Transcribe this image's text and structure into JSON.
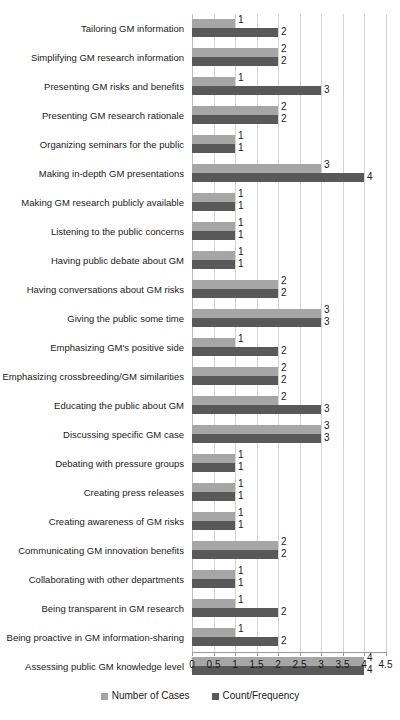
{
  "chart_data": {
    "type": "bar",
    "orientation": "horizontal",
    "title": "",
    "subtitle": "",
    "xlabel": "",
    "ylabel": "",
    "xlim": [
      0,
      4.5
    ],
    "xticks": [
      "0",
      "0.5",
      "1",
      "1.5",
      "2",
      "2.5",
      "3",
      "3.5",
      "4",
      "4.5"
    ],
    "xtick_values": [
      0,
      0.5,
      1,
      1.5,
      2,
      2.5,
      3,
      3.5,
      4,
      4.5
    ],
    "grid": true,
    "grid_axis": "x",
    "legend_position": "bottom",
    "categories": [
      "Tailoring GM information",
      "Simplifying GM research information",
      "Presenting GM risks and benefits",
      "Presenting GM research rationale",
      "Organizing seminars for the public",
      "Making in-depth GM presentations",
      "Making GM research publicly available",
      "Listening to the public concerns",
      "Having public debate about GM",
      "Having conversations about GM risks",
      "Giving the public some time",
      "Emphasizing GM's positive side",
      "Emphasizing crossbreeding/GM similarities",
      "Educating the public about GM",
      "Discussing specific GM case",
      "Debating with pressure groups",
      "Creating press releases",
      "Creating awareness of GM risks",
      "Communicating GM innovation benefits",
      "Collaborating with other departments",
      "Being transparent in GM research",
      "Being proactive in GM information-sharing",
      "Assessing public GM knowledge level"
    ],
    "series": [
      {
        "name": "Number of Cases",
        "color": "#a6a6a6",
        "values": [
          1,
          2,
          1,
          2,
          1,
          3,
          1,
          1,
          1,
          2,
          3,
          1,
          2,
          2,
          3,
          1,
          1,
          1,
          2,
          1,
          1,
          1,
          4
        ],
        "labels": [
          "1",
          "2",
          "1",
          "2",
          "1",
          "3",
          "1",
          "1",
          "1",
          "2",
          "3",
          "1",
          "2",
          "2",
          "3",
          "1",
          "1",
          "1",
          "2",
          "1",
          "1",
          "1",
          "4"
        ]
      },
      {
        "name": "Count/Frequency",
        "color": "#595959",
        "values": [
          2,
          2,
          3,
          2,
          1,
          4,
          1,
          1,
          1,
          2,
          3,
          2,
          2,
          3,
          3,
          1,
          1,
          1,
          2,
          1,
          2,
          2,
          4
        ],
        "labels": [
          "2",
          "2",
          "3",
          "2",
          "1",
          "4",
          "1",
          "1",
          "1",
          "2",
          "3",
          "2",
          "2",
          "3",
          "3",
          "1",
          "1",
          "1",
          "2",
          "1",
          "2",
          "2",
          "4"
        ]
      }
    ]
  },
  "legend": {
    "items": [
      {
        "label": "Number of Cases",
        "color": "#a6a6a6"
      },
      {
        "label": "Count/Frequency",
        "color": "#595959"
      }
    ]
  }
}
